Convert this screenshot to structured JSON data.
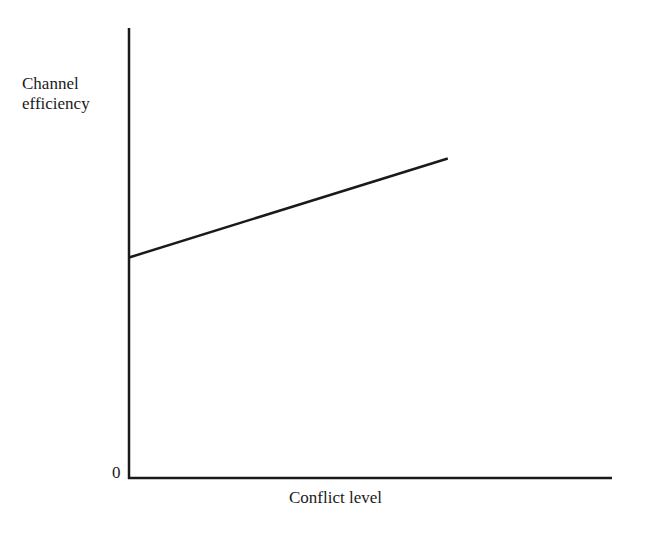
{
  "chart_data": {
    "type": "line",
    "title": "",
    "xlabel": "Conflict level",
    "ylabel": "Channel efficiency",
    "ylabel_lines": [
      "Channel",
      "efficiency"
    ],
    "origin_label": "0",
    "x_ticks": [],
    "y_ticks": [
      "0"
    ],
    "grid": false,
    "legend": null,
    "xlim": [
      0,
      1
    ],
    "ylim": [
      0,
      1
    ],
    "series": [
      {
        "name": "Channel efficiency vs conflict level",
        "x": [
          0,
          0.66
        ],
        "y": [
          0.49,
          0.71
        ],
        "color": "#1a1a1a"
      }
    ]
  },
  "colors": {
    "axis": "#1a1a1a",
    "line": "#1a1a1a",
    "background": "#ffffff"
  }
}
